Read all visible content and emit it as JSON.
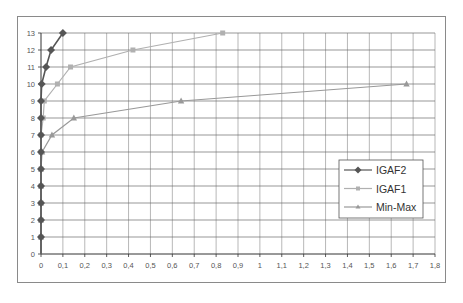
{
  "chart_data": {
    "type": "line",
    "title": "",
    "xlabel": "",
    "ylabel": "",
    "xlim": [
      0,
      1.8
    ],
    "ylim": [
      0,
      13
    ],
    "grid": true,
    "legend_position": "right-lower-inside",
    "x_ticks": [
      "0",
      "0,1",
      "0,2",
      "0,3",
      "0,4",
      "0,5",
      "0,6",
      "0,7",
      "0,8",
      "0,9",
      "1",
      "1,1",
      "1,2",
      "1,3",
      "1,4",
      "1,5",
      "1,6",
      "1,7",
      "1,8"
    ],
    "y_ticks": [
      "0",
      "1",
      "2",
      "3",
      "4",
      "5",
      "6",
      "7",
      "8",
      "9",
      "10",
      "11",
      "12",
      "13"
    ],
    "series": [
      {
        "name": "IGAF2",
        "marker": "diamond",
        "color": "#555555",
        "points": [
          [
            0,
            1
          ],
          [
            0,
            2
          ],
          [
            0,
            3
          ],
          [
            0,
            4
          ],
          [
            0,
            5
          ],
          [
            0,
            6
          ],
          [
            0,
            7
          ],
          [
            0,
            8
          ],
          [
            0,
            9
          ],
          [
            0.003,
            10
          ],
          [
            0.023,
            11
          ],
          [
            0.046,
            12
          ],
          [
            0.1,
            13
          ]
        ]
      },
      {
        "name": "IGAF1",
        "marker": "square",
        "color": "#b0b0b0",
        "points": [
          [
            0,
            1
          ],
          [
            0,
            2
          ],
          [
            0,
            3
          ],
          [
            0,
            4
          ],
          [
            0,
            5
          ],
          [
            0,
            6
          ],
          [
            0,
            7
          ],
          [
            0.01,
            8
          ],
          [
            0.015,
            9
          ],
          [
            0.075,
            10
          ],
          [
            0.135,
            11
          ],
          [
            0.42,
            12
          ],
          [
            0.83,
            13
          ]
        ]
      },
      {
        "name": "Min-Max",
        "marker": "triangle",
        "color": "#999999",
        "points": [
          [
            0,
            1
          ],
          [
            0,
            2
          ],
          [
            0,
            3
          ],
          [
            0,
            4
          ],
          [
            0,
            5
          ],
          [
            0.005,
            6
          ],
          [
            0.05,
            7
          ],
          [
            0.15,
            8
          ],
          [
            0.64,
            9
          ],
          [
            1.67,
            10
          ]
        ]
      }
    ]
  },
  "legend": {
    "items": [
      "IGAF2",
      "IGAF1",
      "Min-Max"
    ]
  }
}
